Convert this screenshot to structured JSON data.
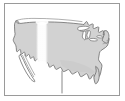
{
  "image": {
    "kind": "map-thumbnail",
    "subject": "Contiguous United States",
    "width_px": 125,
    "height_px": 101,
    "alt_text": "Small grayscale outline map of the contiguous United States"
  },
  "frame": {
    "visible": true,
    "border_color": "#9a9a9a",
    "border_width_px": 1,
    "inset_left_px": 4,
    "inset_top_px": 3,
    "width_px": 116,
    "height_px": 93
  },
  "colors": {
    "background": "#ffffff",
    "land_fill": "#d2d2d2",
    "land_fill_shaded": "#c6c6c6",
    "outline": "#6b6b6b",
    "outline_light": "#8d8d8d",
    "lake_fill": "#ffffff",
    "glare": "#ffffff",
    "frame_border": "#9a9a9a"
  },
  "regions": [
    {
      "name": "contiguous-united-states",
      "label": "Lower 48 states",
      "fill": "#d2d2d2",
      "outlined": true
    },
    {
      "name": "baja-california-peninsula",
      "label": "Baja California",
      "fill": "#ffffff",
      "outlined": true
    },
    {
      "name": "great-lakes",
      "label": "Great Lakes",
      "fill": "#ffffff",
      "outlined": true
    },
    {
      "name": "florida-peninsula",
      "label": "Florida",
      "fill": "#d2d2d2",
      "outlined": true
    },
    {
      "name": "new-england-coast",
      "label": "New England",
      "fill": "#d2d2d2",
      "outlined": true
    },
    {
      "name": "mexico-border-line",
      "label": "Southern border extension",
      "fill": "none",
      "outlined": true
    }
  ],
  "overlays": [
    {
      "name": "glare-streak",
      "label": "Vertical white highlight over the central plains",
      "color": "#ffffff",
      "x_px": 36,
      "y_px": 22,
      "width_px": 12,
      "height_px": 45
    }
  ],
  "labels": {
    "has_text_labels": false,
    "has_legend": false,
    "has_scale_bar": false,
    "has_compass": false
  }
}
